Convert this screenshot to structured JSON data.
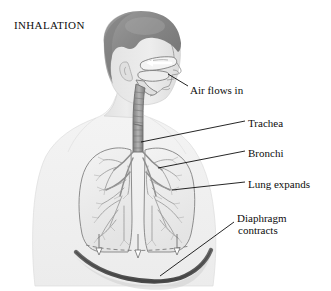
{
  "figure": {
    "title": "INHALATION",
    "view": "left profile head and upper torso with frontal chest cutaway",
    "background_color": "#ffffff",
    "line_color": "#101010"
  },
  "labels": [
    {
      "id": "air",
      "text": "Air flows in",
      "name": "label-air-flows-in"
    },
    {
      "id": "trachea",
      "text": "Trachea",
      "name": "label-trachea"
    },
    {
      "id": "bronchi",
      "text": "Bronchi",
      "name": "label-bronchi"
    },
    {
      "id": "lung",
      "text": "Lung expands",
      "name": "label-lung-expands"
    },
    {
      "id": "diaph1",
      "text": "Diaphragm",
      "name": "label-diaphragm-line1"
    },
    {
      "id": "diaph2",
      "text": "contracts",
      "name": "label-diaphragm-line2"
    }
  ],
  "anatomy": {
    "hair_color": "#8a8a8a",
    "skin_color": "#e8e8e8",
    "body_silhouette_color": "#f2f2f2",
    "lung_fill": "#efefef",
    "airway_color": "#9a9a9a",
    "diaphragm_color": "#5c5c5c",
    "bronchial_tree_color": "#8e8e8e",
    "resting_diaphragm_style": "dashed",
    "airflow_arrow_direction": "inward",
    "diaphragm_arrow_direction": "downward",
    "diaphragm_arrow_count": 3
  }
}
